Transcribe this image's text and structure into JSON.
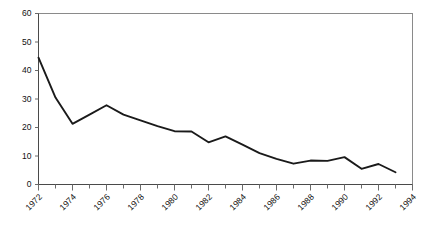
{
  "chart_data": {
    "type": "line",
    "title": "",
    "subtitle": "",
    "xlabel": "",
    "ylabel": "",
    "xlim": [
      1972,
      1994
    ],
    "ylim": [
      0,
      60
    ],
    "grid": false,
    "legend": null,
    "legend_position": "none",
    "y_ticks": [
      0,
      10,
      20,
      30,
      40,
      50,
      60
    ],
    "y_tick_labels": [
      "0",
      "10",
      "20",
      "30",
      "40",
      "50",
      "60"
    ],
    "x_ticks": [
      1972,
      1974,
      1976,
      1978,
      1980,
      1982,
      1984,
      1986,
      1988,
      1990,
      1992,
      1994
    ],
    "x_tick_labels": [
      "1972",
      "1974",
      "1976",
      "1978",
      "1980",
      "1982",
      "1984",
      "1986",
      "1988",
      "1990",
      "1992",
      "1994"
    ],
    "x_minor_ticks": [
      1973,
      1975,
      1977,
      1979,
      1981,
      1983,
      1985,
      1987,
      1989,
      1991,
      1993
    ],
    "x_tick_label_rotation": -45,
    "x": [
      1972,
      1973,
      1974,
      1975,
      1976,
      1977,
      1978,
      1979,
      1980,
      1981,
      1982,
      1983,
      1984,
      1985,
      1986,
      1987,
      1988,
      1989,
      1990,
      1991,
      1992,
      1993
    ],
    "values": [
      44.5,
      30.5,
      21.3,
      24.5,
      27.8,
      24.5,
      22.5,
      20.5,
      18.7,
      18.6,
      14.8,
      16.9,
      14.0,
      11.0,
      9.0,
      7.3,
      8.4,
      8.3,
      9.6,
      5.5,
      7.2,
      4.3
    ],
    "series": [
      {
        "name": "series-1",
        "color": "#1a1a1a",
        "values": [
          44.5,
          30.5,
          21.3,
          24.5,
          27.8,
          24.5,
          22.5,
          20.5,
          18.7,
          18.6,
          14.8,
          16.9,
          14.0,
          11.0,
          9.0,
          7.3,
          8.4,
          8.3,
          9.6,
          5.5,
          7.2,
          4.3
        ]
      }
    ],
    "colors": {
      "line": "#1a1a1a",
      "frame": "#8a8a8a",
      "axis": "#4a4a4a",
      "tick": "#6b6b6b",
      "text": "#111111",
      "background": "#ffffff"
    }
  }
}
